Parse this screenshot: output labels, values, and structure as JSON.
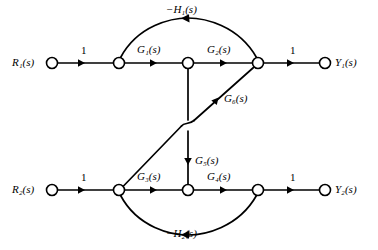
{
  "figure": {
    "type": "signal-flow-graph",
    "width": 378,
    "height": 250,
    "background_color": "#ffffff",
    "line_color": "#000000"
  },
  "nodes": [
    {
      "id": "R1",
      "label": "R",
      "sub": "1",
      "suffix": "(s)",
      "x": 52,
      "y": 63,
      "r": 5.5,
      "kind": "source",
      "label_side": "left"
    },
    {
      "id": "n1",
      "label": "",
      "sub": "",
      "suffix": "",
      "x": 119,
      "y": 63,
      "r": 5.5,
      "kind": "mixed",
      "label_side": "none"
    },
    {
      "id": "n2",
      "label": "",
      "sub": "",
      "suffix": "",
      "x": 188,
      "y": 63,
      "r": 5.5,
      "kind": "mixed",
      "label_side": "none"
    },
    {
      "id": "n3",
      "label": "",
      "sub": "",
      "suffix": "",
      "x": 258,
      "y": 63,
      "r": 5.5,
      "kind": "mixed",
      "label_side": "none"
    },
    {
      "id": "Y1",
      "label": "Y",
      "sub": "1",
      "suffix": "(s)",
      "x": 325,
      "y": 63,
      "r": 5.5,
      "kind": "sink",
      "label_side": "right"
    },
    {
      "id": "R2",
      "label": "R",
      "sub": "2",
      "suffix": "(s)",
      "x": 52,
      "y": 190,
      "r": 5.5,
      "kind": "source",
      "label_side": "left"
    },
    {
      "id": "n4",
      "label": "",
      "sub": "",
      "suffix": "",
      "x": 119,
      "y": 190,
      "r": 5.5,
      "kind": "mixed",
      "label_side": "none"
    },
    {
      "id": "n5",
      "label": "",
      "sub": "",
      "suffix": "",
      "x": 188,
      "y": 190,
      "r": 5.5,
      "kind": "mixed",
      "label_side": "none"
    },
    {
      "id": "n6",
      "label": "",
      "sub": "",
      "suffix": "",
      "x": 258,
      "y": 190,
      "r": 5.5,
      "kind": "mixed",
      "label_side": "none"
    },
    {
      "id": "Y2",
      "label": "Y",
      "sub": "2",
      "suffix": "(s)",
      "x": 325,
      "y": 190,
      "r": 5.5,
      "kind": "sink",
      "label_side": "right"
    }
  ],
  "node_labels": {
    "R1": "R₁(s)",
    "Y1": "Y₁(s)",
    "R2": "R₂(s)",
    "Y2": "Y₂(s)"
  },
  "edges": [
    {
      "id": "e-r1-n1",
      "from": "R1",
      "to": "n1",
      "gain_text": "1",
      "gain_italic": false,
      "shape": "line",
      "direction": "right"
    },
    {
      "id": "e-n1-n2",
      "from": "n1",
      "to": "n2",
      "gain_text": "G₁(s)",
      "gain_italic": true,
      "shape": "line",
      "direction": "right"
    },
    {
      "id": "e-n2-n3",
      "from": "n2",
      "to": "n3",
      "gain_text": "G₂(s)",
      "gain_italic": true,
      "shape": "line",
      "direction": "right"
    },
    {
      "id": "e-n3-y1",
      "from": "n3",
      "to": "Y1",
      "gain_text": "1",
      "gain_italic": false,
      "shape": "line",
      "direction": "right"
    },
    {
      "id": "e-n3-n1-fb",
      "from": "n3",
      "to": "n1",
      "gain_text": "−H₁(s)",
      "gain_italic": true,
      "shape": "arc-up",
      "direction": "left"
    },
    {
      "id": "e-r2-n4",
      "from": "R2",
      "to": "n4",
      "gain_text": "1",
      "gain_italic": false,
      "shape": "line",
      "direction": "right"
    },
    {
      "id": "e-n4-n5",
      "from": "n4",
      "to": "n5",
      "gain_text": "G₃(s)",
      "gain_italic": true,
      "shape": "line",
      "direction": "right"
    },
    {
      "id": "e-n5-n6",
      "from": "n5",
      "to": "n6",
      "gain_text": "G₄(s)",
      "gain_italic": true,
      "shape": "line",
      "direction": "right"
    },
    {
      "id": "e-n6-y2",
      "from": "n6",
      "to": "Y2",
      "gain_text": "1",
      "gain_italic": false,
      "shape": "line",
      "direction": "right"
    },
    {
      "id": "e-n6-n4-fb",
      "from": "n6",
      "to": "n4",
      "gain_text": "−H₂(s)",
      "gain_italic": true,
      "shape": "arc-down",
      "direction": "left"
    },
    {
      "id": "e-n2-n5",
      "from": "n2",
      "to": "n5",
      "gain_text": "G₅(s)",
      "gain_italic": true,
      "shape": "vertical",
      "direction": "down"
    },
    {
      "id": "e-n3-n4",
      "from": "n3",
      "to": "n4",
      "gain_text": "G₆(s)",
      "gain_italic": true,
      "shape": "diagonal-hop",
      "direction": "down-left"
    }
  ],
  "edge_labels": {
    "gain_r1": "1",
    "gain_g1": "G₁(s)",
    "gain_g2": "G₂(s)",
    "gain_y1": "1",
    "gain_h1": "−H₁(s)",
    "gain_r2": "1",
    "gain_g3": "G₃(s)",
    "gain_g4": "G₄(s)",
    "gain_y2": "1",
    "gain_h2": "−H₂(s)",
    "gain_g5": "G₅(s)",
    "gain_g6": "G₆(s)"
  }
}
